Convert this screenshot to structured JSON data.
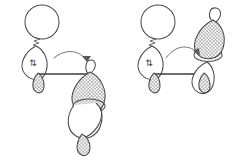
{
  "figure": {
    "background_color": "#ffffff",
    "stroke_color": "#4a4a4a",
    "bond_color": "#3d3d3d",
    "shade_color": "#9a9a9a",
    "panel_count": 2
  },
  "symbols": {
    "electron_pair": "⇅",
    "electron_pair_name": "paired-electrons-up-down-arrows"
  },
  "panels": [
    {
      "id": "left-structure",
      "label": "left-resonance-structure",
      "parts": {
        "top_sphere": {
          "name": "s-orbital-sphere",
          "fill": "open",
          "cx": 42,
          "cy": 22,
          "r": 17
        },
        "squiggle_bond": {
          "name": "squiggle-bond",
          "style": "zigzag"
        },
        "donor_lobe": {
          "name": "donor-orbital-lobe",
          "fill": "open",
          "contains": "electron_pair"
        },
        "donor_back_lobe": {
          "name": "donor-back-lobe",
          "fill": "shaded"
        },
        "bond_line": {
          "name": "sigma-bond-line",
          "from_x": 40,
          "from_y": 74,
          "to_x": 88,
          "to_y": 74
        },
        "acceptor_p_orbital": {
          "name": "acceptor-p-orbital",
          "top_lobe_fill": "shaded",
          "bottom_lobe_fill": "open",
          "orientation": "vertical",
          "position": "below-bond"
        },
        "acceptor_tail_lobe": {
          "name": "acceptor-tail-lobe",
          "fill": "shaded"
        },
        "curved_arrow": {
          "name": "electron-pushing-arrow",
          "direction": "left-to-right-downward",
          "curvature": "concave-up"
        }
      }
    },
    {
      "id": "right-structure",
      "label": "right-resonance-structure",
      "parts": {
        "top_sphere": {
          "name": "s-orbital-sphere",
          "fill": "open",
          "cx": 158,
          "cy": 22,
          "r": 17
        },
        "squiggle_bond": {
          "name": "squiggle-bond",
          "style": "zigzag"
        },
        "donor_lobe": {
          "name": "donor-orbital-lobe",
          "fill": "open",
          "contains": "electron_pair"
        },
        "donor_back_lobe": {
          "name": "donor-back-lobe",
          "fill": "shaded"
        },
        "bond_line": {
          "name": "sigma-bond-line",
          "from_x": 156,
          "from_y": 74,
          "to_x": 204,
          "to_y": 74
        },
        "acceptor_p_orbital": {
          "name": "acceptor-p-orbital",
          "top_lobe_fill": "shaded",
          "bottom_lobe_fill": "open",
          "orientation": "vertical",
          "position": "above-bond"
        },
        "acceptor_tail_lobe": {
          "name": "acceptor-tail-lobe",
          "fill": "shaded"
        },
        "curved_arrow": {
          "name": "electron-pushing-arrow",
          "direction": "left-to-right-upward-arc",
          "curvature": "concave-down"
        }
      }
    }
  ]
}
